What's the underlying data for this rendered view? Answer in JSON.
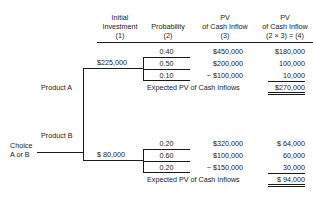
{
  "headers": [
    {
      "line1": "",
      "line2": "Initial",
      "line3": "Investment",
      "line4": "(1)"
    },
    {
      "line1": "",
      "line2": "",
      "line3": "Probability",
      "line4": "(2)"
    },
    {
      "line1": "",
      "line2": "PV",
      "line3": "of Cash Inflow",
      "line4": "(3)"
    },
    {
      "line1": "",
      "line2": "PV",
      "line3": "of Cash Inflow",
      "line4": "(2 × 3) = (4)"
    }
  ],
  "root": {
    "label_line1": "Choice",
    "label_line2": "A or B"
  },
  "branches": [
    {
      "label": "Product A",
      "investment": "$225,000",
      "outcomes": [
        {
          "probability": "0.40",
          "pv": "$450,000",
          "weighted": "$180,000"
        },
        {
          "probability": "0.50",
          "pv": "$200,000",
          "weighted": "100,000"
        },
        {
          "probability": "0.10",
          "pv": "− $100,000",
          "weighted": "10,000"
        }
      ],
      "expected_label": "Expected PV of Cash Inflows",
      "expected_value": "$270,000"
    },
    {
      "label": "Product B",
      "investment": "$  80,000",
      "outcomes": [
        {
          "probability": "0.20",
          "pv": "$320,000",
          "weighted": "$  64,000"
        },
        {
          "probability": "0.60",
          "pv": "$100,000",
          "weighted": "60,000"
        },
        {
          "probability": "0.20",
          "pv": "− $150,000",
          "weighted": "30,000"
        }
      ],
      "expected_label": "Expected PV of Cash Inflows",
      "expected_value": "$  94,000"
    }
  ]
}
